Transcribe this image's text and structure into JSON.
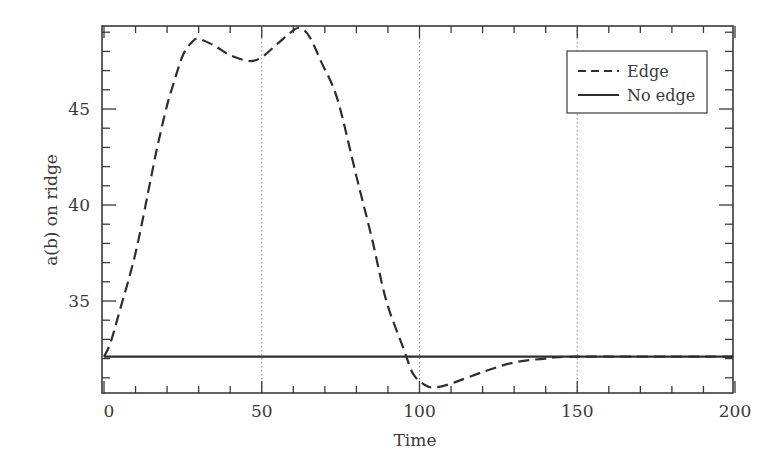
{
  "chart_data": {
    "type": "line",
    "title": "",
    "xlabel": "Time",
    "ylabel": "a(b) on ridge",
    "xlim": [
      -0.7,
      200
    ],
    "xlim_plot": [
      -0.7,
      200
    ],
    "x_max_visible": 200,
    "ylim": [
      30.2,
      49.3
    ],
    "xticks": [
      0,
      50,
      100,
      150,
      200
    ],
    "xtick_labels": [
      "0",
      "50",
      "100",
      "150",
      "200"
    ],
    "yticks": [
      35,
      40,
      45
    ],
    "ytick_labels": [
      "35",
      "40",
      "45"
    ],
    "grid": false,
    "reference_lines_x": [
      50,
      100,
      150
    ],
    "legend_position": "upper right",
    "series": [
      {
        "name": "Edge",
        "style": "dashed",
        "x": [
          0,
          2,
          5,
          10,
          15,
          17,
          20,
          22,
          25,
          28,
          30,
          35,
          40,
          46,
          50,
          55,
          60,
          62,
          65,
          69,
          74,
          80,
          85,
          89.5,
          95,
          98,
          102,
          105,
          110,
          120,
          130,
          140,
          150,
          210
        ],
        "values": [
          32.1,
          32.8,
          34.5,
          37.5,
          41.5,
          43.1,
          45.2,
          46.3,
          47.8,
          48.5,
          48.65,
          48.3,
          47.8,
          47.5,
          47.7,
          48.4,
          49.1,
          49.2,
          48.8,
          47.4,
          45.5,
          41.5,
          38.2,
          35.0,
          32.5,
          31.2,
          30.6,
          30.5,
          30.7,
          31.3,
          31.8,
          32.0,
          32.1,
          32.1
        ]
      },
      {
        "name": "No edge",
        "style": "solid",
        "x": [
          0,
          210
        ],
        "values": [
          32.1,
          32.1
        ]
      }
    ]
  },
  "legend": {
    "items": [
      {
        "label": "Edge"
      },
      {
        "label": "No edge"
      }
    ]
  },
  "colors": {
    "line": "#2e2e2e",
    "axis": "#3a3a3a",
    "reference": "#8a8a8a"
  }
}
